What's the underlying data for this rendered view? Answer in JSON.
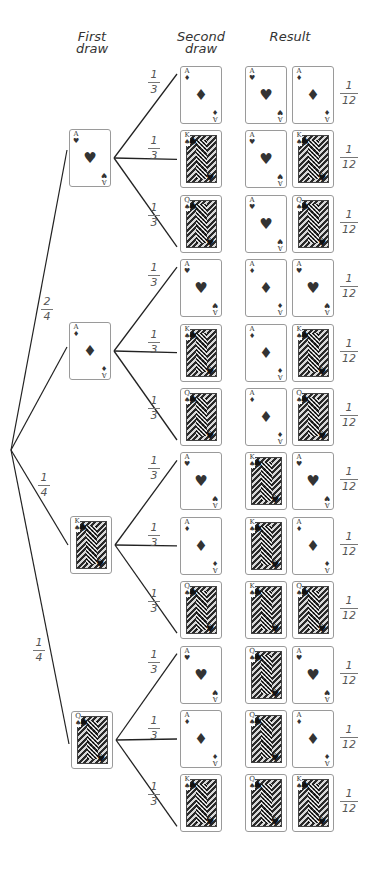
{
  "headers": {
    "first_draw": [
      "First",
      "draw"
    ],
    "second_draw": [
      "Second",
      "draw"
    ],
    "result": "Result"
  },
  "colors": {
    "line": "#222222",
    "card_border": "#9a9a9a",
    "text": "#333333"
  },
  "root": {
    "x": 11,
    "y": 450
  },
  "first_draw": [
    {
      "card": "A-hearts",
      "rank": "A",
      "suit": "hearts",
      "face": false,
      "x": 69,
      "y": 129,
      "prob": "",
      "branches": [
        {
          "card": "A-diamonds",
          "rank": "A",
          "suit": "diamonds",
          "face": false,
          "prob": "1/3",
          "result": [
            "A-hearts",
            "A-diamonds"
          ],
          "result_prob": "1/12"
        },
        {
          "card": "K-spades",
          "rank": "K",
          "suit": "spades",
          "face": true,
          "prob": "1/3",
          "result": [
            "A-hearts",
            "K-spades"
          ],
          "result_prob": "1/12"
        },
        {
          "card": "Q-spades",
          "rank": "Q",
          "suit": "spades",
          "face": true,
          "prob": "1/3",
          "result": [
            "A-hearts",
            "Q-spades"
          ],
          "result_prob": "1/12"
        }
      ]
    },
    {
      "card": "A-diamonds",
      "rank": "A",
      "suit": "diamonds",
      "face": false,
      "x": 69,
      "y": 322,
      "prob": "2/4",
      "branches": [
        {
          "card": "A-hearts",
          "rank": "A",
          "suit": "hearts",
          "face": false,
          "prob": "1/3",
          "result": [
            "A-diamonds",
            "A-hearts"
          ],
          "result_prob": "1/12"
        },
        {
          "card": "K-spades",
          "rank": "K",
          "suit": "spades",
          "face": true,
          "prob": "1/3",
          "result": [
            "A-diamonds",
            "K-spades"
          ],
          "result_prob": "1/12"
        },
        {
          "card": "Q-spades",
          "rank": "Q",
          "suit": "spades",
          "face": true,
          "prob": "1/3",
          "result": [
            "A-diamonds",
            "Q-spades"
          ],
          "result_prob": "1/12"
        }
      ]
    },
    {
      "card": "K-spades",
      "rank": "K",
      "suit": "spades",
      "face": true,
      "x": 70,
      "y": 516,
      "prob": "1/4",
      "branches": [
        {
          "card": "A-hearts",
          "rank": "A",
          "suit": "hearts",
          "face": false,
          "prob": "1/3",
          "result": [
            "K-spades",
            "A-hearts"
          ],
          "result_prob": "1/12"
        },
        {
          "card": "A-diamonds",
          "rank": "A",
          "suit": "diamonds",
          "face": false,
          "prob": "1/3",
          "result": [
            "K-spades",
            "A-diamonds"
          ],
          "result_prob": "1/12"
        },
        {
          "card": "Q-spades",
          "rank": "Q",
          "suit": "spades",
          "face": true,
          "prob": "1/3",
          "result": [
            "K-spades",
            "Q-spades"
          ],
          "result_prob": "1/12"
        }
      ]
    },
    {
      "card": "Q-spades",
      "rank": "Q",
      "suit": "spades",
      "face": true,
      "x": 71,
      "y": 711,
      "prob": "1/4",
      "branches": [
        {
          "card": "A-hearts",
          "rank": "A",
          "suit": "hearts",
          "face": false,
          "prob": "1/3",
          "result": [
            "Q-spades",
            "A-hearts"
          ],
          "result_prob": "1/12"
        },
        {
          "card": "A-diamonds",
          "rank": "A",
          "suit": "diamonds",
          "face": false,
          "prob": "1/3",
          "result": [
            "Q-spades",
            "A-diamonds"
          ],
          "result_prob": "1/12"
        },
        {
          "card": "K-spades",
          "rank": "K",
          "suit": "spades",
          "face": true,
          "prob": "1/3",
          "result": [
            "Q-spades",
            "K-spades"
          ],
          "result_prob": "1/12"
        }
      ]
    }
  ],
  "first_prob_labels": [
    {
      "text": "2/4",
      "x": 41,
      "y": 296
    },
    {
      "text": "1/4",
      "x": 38,
      "y": 472
    },
    {
      "text": "1/4",
      "x": 33,
      "y": 637
    }
  ],
  "layout": {
    "second_x": 180,
    "result_x1": 245,
    "result_x2": 292,
    "row0_y": 66,
    "row_step": 64.4,
    "card_w": 42,
    "card_h": 58,
    "branch_prob_x": 148,
    "result_prob_x": 340
  }
}
